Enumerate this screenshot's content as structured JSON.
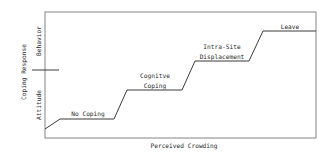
{
  "diagram": {
    "type": "step-progression",
    "x_axis_label": "Perceived Crowding",
    "y_axis_label": "Coping Response",
    "y_regions": [
      {
        "id": "behavior",
        "label": "Behavior"
      },
      {
        "id": "attitude",
        "label": "Attitude"
      }
    ],
    "stages": [
      {
        "id": "no-coping",
        "lines": [
          "No Coping"
        ]
      },
      {
        "id": "cognitive-coping",
        "lines": [
          "Cognitve",
          "Coping"
        ]
      },
      {
        "id": "intra-site-displacement",
        "lines": [
          "Intra-Site",
          "Displacement"
        ]
      },
      {
        "id": "leave",
        "lines": [
          "Leave"
        ]
      }
    ],
    "colors": {
      "line": "#3a3a3a",
      "frame": "#777777",
      "text": "#2a2a2a",
      "background": "#ffffff"
    }
  }
}
